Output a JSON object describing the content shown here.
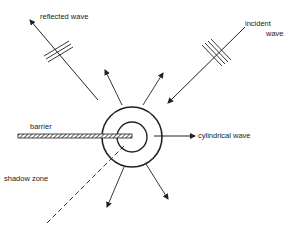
{
  "diagram": {
    "labels": {
      "reflected": "reflected wave",
      "incident_1": "incident",
      "incident_2": "wave",
      "barrier": "barrier",
      "cylindrical": "cylindrical wave",
      "shadow": "shadow zone"
    },
    "colors": {
      "stroke": "#222222",
      "background": "#ffffff"
    }
  }
}
